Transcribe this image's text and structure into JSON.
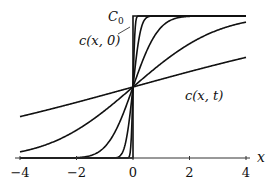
{
  "chart_data": {
    "type": "line",
    "title": "",
    "xlabel": "x",
    "ylabel": "",
    "xlim": [
      -4,
      4
    ],
    "ylim": [
      0,
      1
    ],
    "x_ticks": [
      -4,
      -2,
      0,
      2,
      4
    ],
    "x_tick_labels": [
      "−4",
      "−2",
      "0",
      "2",
      "4"
    ],
    "grid": false,
    "legend": null,
    "annotations": [
      {
        "text": "C₀",
        "target": "upper plateau (c = C₀)"
      },
      {
        "text": "c(x, 0)",
        "target": "initial step profile at x = 0"
      },
      {
        "text": "c(x, t)",
        "target": "diffusing profiles"
      }
    ],
    "series": [
      {
        "name": "c(x,0) step",
        "width_2sqrtDt": 0
      },
      {
        "name": "c(x,t1)",
        "width_2sqrtDt": 0.08
      },
      {
        "name": "c(x,t2)",
        "width_2sqrtDt": 0.3
      },
      {
        "name": "c(x,t3)",
        "width_2sqrtDt": 1.0
      },
      {
        "name": "c(x,t4)",
        "width_2sqrtDt": 3.3
      },
      {
        "name": "c(x,t5)",
        "width_2sqrtDt": 10.3
      }
    ],
    "sample_values": {
      "x": [
        -4,
        -2,
        0,
        2,
        4
      ],
      "c(x,t4)": [
        0.04,
        0.2,
        0.5,
        0.8,
        0.96
      ],
      "c(x,t5)": [
        0.29,
        0.39,
        0.5,
        0.61,
        0.71
      ]
    }
  },
  "labels": {
    "c0": "C",
    "c0_sub": "0",
    "initial": "c(x, 0)",
    "general": "c(x, t)",
    "x_axis": "x"
  }
}
